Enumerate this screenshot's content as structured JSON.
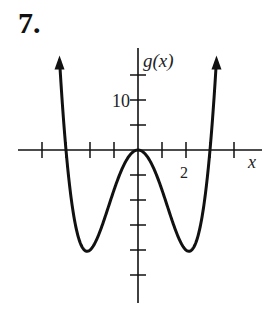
{
  "problem_number": "7.",
  "chart_data": {
    "type": "line",
    "title": "",
    "xlabel": "x",
    "ylabel": "g(x)",
    "function": "g(x) = x^4 - 9x^2",
    "x_tick_labels": [
      {
        "value": 2,
        "label": "2"
      }
    ],
    "y_tick_labels": [
      {
        "value": 10,
        "label": "10"
      }
    ],
    "x_ticks": [
      -4,
      -3,
      -2,
      -1,
      0,
      1,
      2,
      3,
      4
    ],
    "y_ticks": [
      -25,
      -20,
      -15,
      -10,
      -5,
      5,
      10,
      15
    ],
    "xlim": [
      -4.5,
      4.5
    ],
    "ylim": [
      -28,
      20
    ],
    "grid": false,
    "key_points": [
      {
        "x": -3,
        "y": 0
      },
      {
        "x": -2.12,
        "y": -20.25
      },
      {
        "x": 0,
        "y": 0
      },
      {
        "x": 2.12,
        "y": -20.25
      },
      {
        "x": 3,
        "y": 0
      }
    ],
    "arrows": "both ends point upward"
  }
}
